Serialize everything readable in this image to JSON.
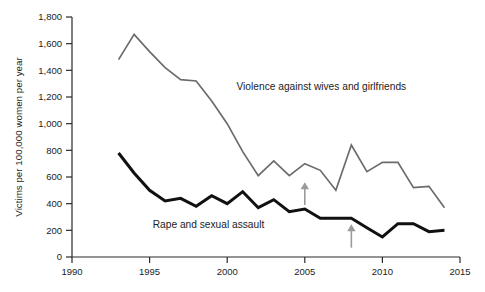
{
  "chart_data": {
    "type": "line",
    "title": "",
    "xlabel": "",
    "ylabel": "Victims per 100,000 women per year",
    "xlim": [
      1990,
      2015
    ],
    "ylim": [
      0,
      1800
    ],
    "grid": false,
    "legend_position": "inline-labels",
    "x_ticks": [
      "1990",
      "1995",
      "2000",
      "2005",
      "2010",
      "2015"
    ],
    "x_tick_values": [
      1990,
      1995,
      2000,
      2005,
      2010,
      2015
    ],
    "y_ticks": [
      "0",
      "200",
      "400",
      "600",
      "800",
      "1,000",
      "1,200",
      "1,400",
      "1,600",
      "1,800"
    ],
    "y_tick_values": [
      0,
      200,
      400,
      600,
      800,
      1000,
      1200,
      1400,
      1600,
      1800
    ],
    "x": [
      1993,
      1994,
      1995,
      1996,
      1997,
      1998,
      1999,
      2000,
      2001,
      2002,
      2003,
      2004,
      2005,
      2006,
      2007,
      2008,
      2009,
      2010,
      2011,
      2012,
      2013,
      2014
    ],
    "series": [
      {
        "name": "Violence against wives and girlfriends",
        "color": "#6b6b6b",
        "width": 1.7,
        "values": [
          1480,
          1670,
          1540,
          1420,
          1330,
          1320,
          1170,
          1000,
          790,
          610,
          720,
          610,
          700,
          650,
          500,
          840,
          640,
          710,
          710,
          520,
          530,
          370
        ]
      },
      {
        "name": "Rape and sexual assault",
        "color": "#111111",
        "width": 3.0,
        "values": [
          780,
          630,
          500,
          420,
          440,
          380,
          460,
          400,
          490,
          370,
          430,
          340,
          360,
          290,
          290,
          290,
          220,
          150,
          250,
          250,
          190,
          200
        ]
      }
    ],
    "annotations": [
      {
        "name": "arrow-violence-2005",
        "label": "",
        "x": 2005,
        "y_from": 390,
        "y_to": 560,
        "color": "#9a9a9a",
        "direction": "up"
      },
      {
        "name": "arrow-rape-2008",
        "label": "",
        "x": 2008,
        "y_from": 70,
        "y_to": 245,
        "color": "#9a9a9a",
        "direction": "up"
      }
    ],
    "series_inline_labels": [
      {
        "text": "Violence against wives and girlfriends",
        "x": 2000.6,
        "y": 1250
      },
      {
        "text": "Rape and sexual assault",
        "x": 1995.2,
        "y": 215
      }
    ]
  }
}
